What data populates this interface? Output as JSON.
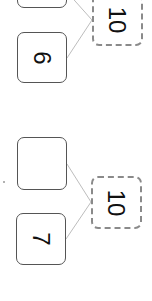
{
  "bonds": [
    {
      "whole": "10",
      "parts": [
        "",
        "6"
      ]
    },
    {
      "whole": "10",
      "parts": [
        "",
        "7"
      ]
    }
  ],
  "colors": {
    "part_border": "#555555",
    "whole_border": "#8a8a8a",
    "connector": "#bdbdbd"
  }
}
